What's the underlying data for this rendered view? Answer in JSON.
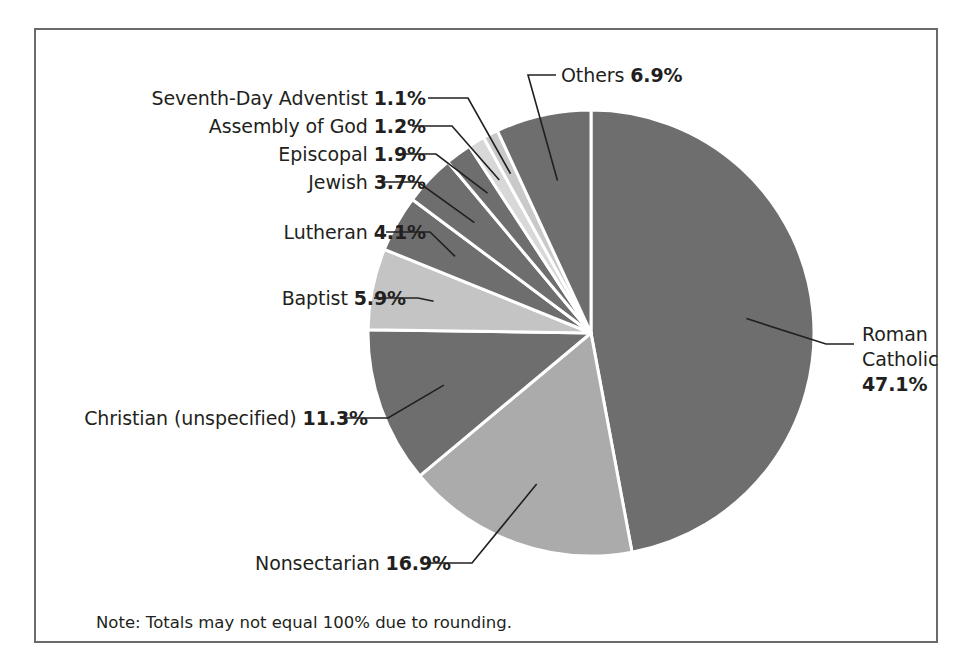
{
  "figure": {
    "note": "Note: Totals may not equal 100% due to rounding.",
    "frame_color": "#6a6a6a",
    "background": "#ffffff"
  },
  "chart_data": {
    "type": "pie",
    "title": "",
    "subtitle": "",
    "xlabel": "",
    "ylabel": "",
    "legend_position": "none",
    "grid": false,
    "units": "percent",
    "start_angle_deg": 0,
    "direction": "clockwise",
    "note": "Note: Totals may not equal 100% due to rounding.",
    "categories": [
      "Roman Catholic",
      "Nonsectarian",
      "Christian (unspecified)",
      "Baptist",
      "Lutheran",
      "Jewish",
      "Episcopal",
      "Assembly of God",
      "Seventh-Day Adventist",
      "Others"
    ],
    "values": [
      47.1,
      16.9,
      11.3,
      5.9,
      4.1,
      3.7,
      1.9,
      1.2,
      1.1,
      6.9
    ],
    "colors": [
      "#6e6e6e",
      "#ababab",
      "#6e6e6e",
      "#c4c4c4",
      "#6e6e6e",
      "#6e6e6e",
      "#6e6e6e",
      "#d8d8d8",
      "#c9c9c9",
      "#6e6e6e"
    ],
    "slice_border_color": "#ffffff",
    "labels": [
      {
        "name": "Roman Catholic",
        "value": 47.1,
        "text": "Roman Catholic",
        "pct": "47.1%"
      },
      {
        "name": "Nonsectarian",
        "value": 16.9,
        "text": "Nonsectarian",
        "pct": "16.9%"
      },
      {
        "name": "Christian (unspecified)",
        "value": 11.3,
        "text": "Christian (unspecified)",
        "pct": "11.3%"
      },
      {
        "name": "Baptist",
        "value": 5.9,
        "text": "Baptist",
        "pct": "5.9%"
      },
      {
        "name": "Lutheran",
        "value": 4.1,
        "text": "Lutheran",
        "pct": "4.1%"
      },
      {
        "name": "Jewish",
        "value": 3.7,
        "text": "Jewish",
        "pct": "3.7%"
      },
      {
        "name": "Episcopal",
        "value": 1.9,
        "text": "Episcopal",
        "pct": "1.9%"
      },
      {
        "name": "Assembly of God",
        "value": 1.2,
        "text": "Assembly of God",
        "pct": "1.2%"
      },
      {
        "name": "Seventh-Day Adventist",
        "value": 1.1,
        "text": "Seventh-Day Adventist",
        "pct": "1.1%"
      },
      {
        "name": "Others",
        "value": 6.9,
        "text": "Others",
        "pct": "6.9%"
      }
    ]
  },
  "labels": {
    "seventh_day_adventist": {
      "name": "Seventh-Day Adventist",
      "pct": "1.1%"
    },
    "assembly_of_god": {
      "name": "Assembly of God",
      "pct": "1.2%"
    },
    "episcopal": {
      "name": "Episcopal",
      "pct": "1.9%"
    },
    "jewish": {
      "name": "Jewish",
      "pct": "3.7%"
    },
    "lutheran": {
      "name": "Lutheran",
      "pct": "4.1%"
    },
    "baptist": {
      "name": "Baptist",
      "pct": "5.9%"
    },
    "christian_unspecified": {
      "name": "Christian (unspecified)",
      "pct": "11.3%"
    },
    "nonsectarian": {
      "name": "Nonsectarian",
      "pct": "16.9%"
    },
    "others": {
      "name": "Others",
      "pct": "6.9%"
    },
    "roman_catholic": {
      "line1": "Roman",
      "line2": "Catholic",
      "pct": "47.1%"
    }
  }
}
